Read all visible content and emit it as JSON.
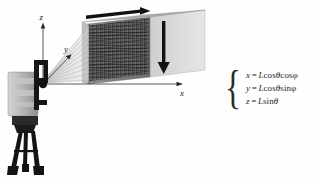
{
  "figure": {
    "background_color": "#fefefe"
  },
  "diagram": {
    "axes": {
      "z_label": "z",
      "y_label": "y",
      "x_label": "x",
      "origin_note": "scanner head"
    },
    "scanner": {
      "name": "terrestrial laser scanner on tripod",
      "body_color": "#b9b9b9",
      "head_color": "#171717"
    },
    "target": {
      "name": "scanned wall surface with scan grid",
      "face_color": "#7c7c7c",
      "grid_color": "#2b2b2b",
      "side_color": "#cfcfcf",
      "top_color": "#9a9a9a"
    },
    "arrows": {
      "horizontal_scan_label": "horizontal scan direction",
      "vertical_scan_label": "vertical scan direction",
      "color": "#111111"
    },
    "beam": {
      "name": "laser beam fan",
      "color": "#c8c8c8"
    }
  },
  "equations": {
    "brace": "{",
    "lines": [
      {
        "lhs": "x",
        "eq": "=",
        "rhs_L": "L",
        "rhs_fn1": "cos",
        "rhs_a1": "θ",
        "rhs_fn2": "cos",
        "rhs_a2": "φ"
      },
      {
        "lhs": "y",
        "eq": "=",
        "rhs_L": "L",
        "rhs_fn1": "cos",
        "rhs_a1": "θ",
        "rhs_fn2": "sin",
        "rhs_a2": "φ"
      },
      {
        "lhs": "z",
        "eq": "=",
        "rhs_L": "L",
        "rhs_fn1": "sin",
        "rhs_a1": "θ",
        "rhs_fn2": "",
        "rhs_a2": ""
      }
    ],
    "plain": [
      "x = Lcosθcosφ",
      "y = Lcosθsinφ",
      "z = Lsinθ"
    ]
  }
}
